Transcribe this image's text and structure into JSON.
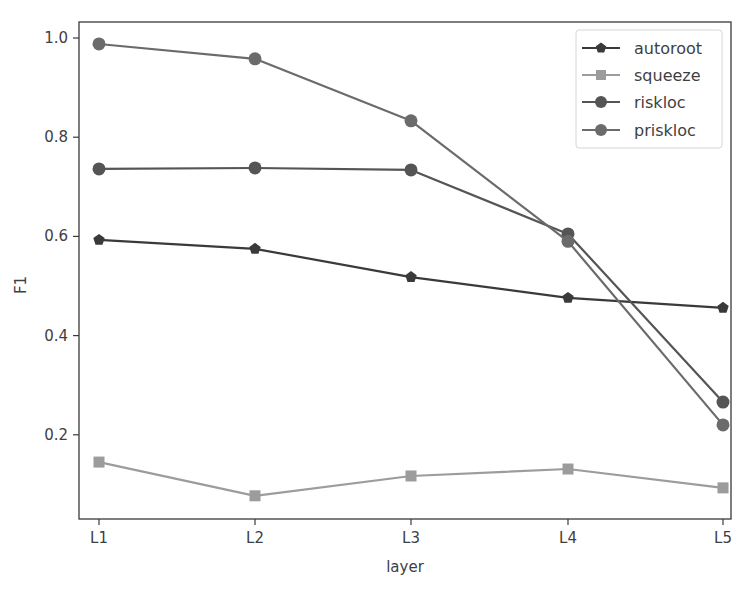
{
  "chart_data": {
    "type": "line",
    "title": "",
    "xlabel": "layer",
    "ylabel": "F1",
    "categories": [
      "L1",
      "L2",
      "L3",
      "L4",
      "L5"
    ],
    "yticks": [
      "0.2",
      "0.4",
      "0.6",
      "0.8",
      "1.0"
    ],
    "ytick_values": [
      0.2,
      0.4,
      0.6,
      0.8,
      1.0
    ],
    "ylim": [
      0.033,
      1.032
    ],
    "grid": false,
    "legend_position": "upper right",
    "series": [
      {
        "name": "autoroot",
        "marker": "pentagon",
        "color": "#3a3a3a",
        "values": [
          0.593,
          0.575,
          0.518,
          0.476,
          0.456
        ]
      },
      {
        "name": "squeeze",
        "marker": "square",
        "color": "#9c9c9c",
        "values": [
          0.145,
          0.077,
          0.117,
          0.131,
          0.093
        ]
      },
      {
        "name": "riskloc",
        "marker": "circle",
        "color": "#555555",
        "values": [
          0.736,
          0.738,
          0.734,
          0.605,
          0.266
        ]
      },
      {
        "name": "priskloc",
        "marker": "circle",
        "color": "#6b6b6b",
        "values": [
          0.988,
          0.958,
          0.833,
          0.59,
          0.22
        ]
      }
    ]
  }
}
